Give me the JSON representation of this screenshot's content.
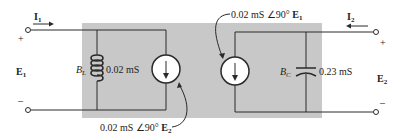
{
  "colors": {
    "shade": "#c8c8c8",
    "wire": "#2a2a2a",
    "background": "#ffffff"
  },
  "port1": {
    "current_label": "I",
    "current_sub": "1",
    "voltage_label": "E",
    "voltage_sub": "1",
    "plus": "+",
    "minus": "–"
  },
  "port2": {
    "current_label": "I",
    "current_sub": "2",
    "voltage_label": "E",
    "voltage_sub": "2",
    "plus": "+",
    "minus": "–"
  },
  "inductor": {
    "symbol": "B",
    "symbol_sub": "L",
    "value": "0.02 mS"
  },
  "capacitor": {
    "symbol": "B",
    "symbol_sub": "C",
    "value": "0.23 mS"
  },
  "source_left": {
    "label_prefix": "0.02 mS ∠90° ",
    "label_var": "E",
    "label_sub": "2"
  },
  "source_right": {
    "label_prefix": "0.02 mS ∠90° ",
    "label_var": "E",
    "label_sub": "1"
  }
}
